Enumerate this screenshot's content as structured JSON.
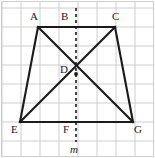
{
  "figure": {
    "width": 155,
    "height": 158,
    "background_color": "#ffffff",
    "frame_color": "#cfcfcf",
    "grid": {
      "visible": true,
      "line_color": "#c8c8c8",
      "cell_size": 19,
      "columns": 8,
      "rows": 8,
      "origin_x": 2,
      "origin_y": 8
    },
    "stroke_color": "#1a1a1a",
    "shape_stroke_width": 2.1,
    "dash_stroke_width": 1.6,
    "dash_pattern": "3,3"
  },
  "points": {
    "A": {
      "label": "A",
      "x": 38,
      "y": 27,
      "label_x": 30,
      "label_y": 11
    },
    "B": {
      "label": "B",
      "x": 76,
      "y": 27,
      "label_x": 61,
      "label_y": 11
    },
    "C": {
      "label": "C",
      "x": 115,
      "y": 27,
      "label_x": 112,
      "label_y": 11
    },
    "D": {
      "label": "D",
      "x": 76,
      "y": 74,
      "label_x": 60,
      "label_y": 64
    },
    "E": {
      "label": "E",
      "x": 20,
      "y": 122,
      "label_x": 11,
      "label_y": 124
    },
    "F": {
      "label": "F",
      "x": 76,
      "y": 122,
      "label_x": 63,
      "label_y": 124
    },
    "G": {
      "label": "G",
      "x": 133,
      "y": 122,
      "label_x": 134,
      "label_y": 124
    }
  },
  "segments": [
    {
      "name": "side-AC-top",
      "from": "A",
      "to": "C",
      "style": "solid"
    },
    {
      "name": "side-EG-bottom",
      "from": "E",
      "to": "G",
      "style": "solid"
    },
    {
      "name": "side-AE-left",
      "from": "A",
      "to": "E",
      "style": "solid"
    },
    {
      "name": "side-CG-right",
      "from": "C",
      "to": "G",
      "style": "solid"
    },
    {
      "name": "diagonal-AG",
      "from": "A",
      "to": "G",
      "style": "solid"
    },
    {
      "name": "diagonal-CE",
      "from": "C",
      "to": "E",
      "style": "solid"
    }
  ],
  "symmetry_line": {
    "name": "line-m",
    "label": "m",
    "style": "dashed",
    "x": 76,
    "y_start": 8,
    "y_end": 142,
    "label_x": 70,
    "label_y": 144
  },
  "labels_order": [
    "A",
    "B",
    "C",
    "D",
    "E",
    "F",
    "G"
  ]
}
